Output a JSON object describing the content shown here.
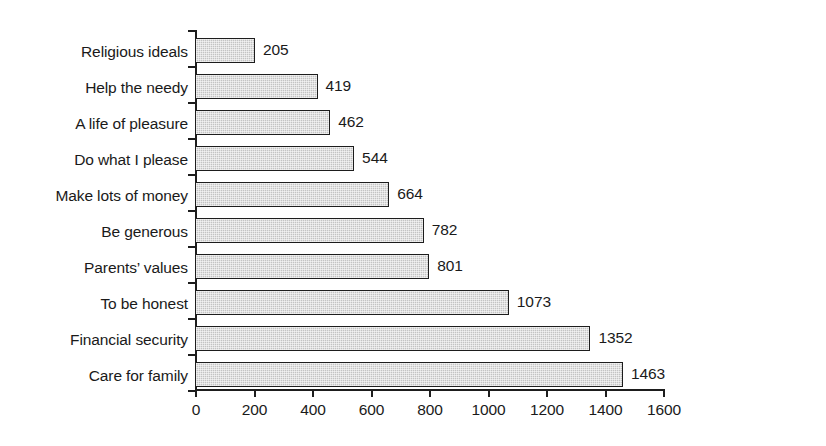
{
  "chart_data": {
    "type": "bar",
    "orientation": "horizontal",
    "title": "",
    "xlabel": "",
    "ylabel": "",
    "xlim": [
      0,
      1600
    ],
    "xticks": [
      0,
      200,
      400,
      600,
      800,
      1000,
      1200,
      1400,
      1600
    ],
    "xtick_labels": [
      "0",
      "200",
      "400",
      "600",
      "800",
      "1000",
      "1200",
      "1400",
      "1600"
    ],
    "grid": false,
    "legend": false,
    "data_labels": true,
    "categories": [
      "Religious ideals",
      "Help the needy",
      "A life of pleasure",
      "Do what I please",
      "Make lots of money",
      "Be generous",
      "Parents’ values",
      "To be honest",
      "Financial security",
      "Care for family"
    ],
    "values": [
      205,
      419,
      462,
      544,
      664,
      782,
      801,
      1073,
      1352,
      1463
    ],
    "value_labels": [
      "205",
      "419",
      "462",
      "544",
      "664",
      "782",
      "801",
      "1073",
      "1352",
      "1463"
    ],
    "colors": {
      "bar_fill": "#c3c3c3",
      "bar_edge": "#1d1d1d",
      "axis": "#1d1d1d",
      "text": "#1a1a1a",
      "background": "#ffffff"
    }
  }
}
